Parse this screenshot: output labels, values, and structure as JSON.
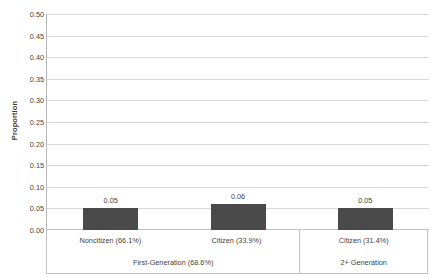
{
  "chart_data": {
    "type": "bar",
    "title": "",
    "subtitle": "",
    "xlabel": "",
    "ylabel": "Proportion",
    "ylim": [
      0.0,
      0.5
    ],
    "ytick_step": 0.05,
    "grid": true,
    "legend": false,
    "bar_color": "#4a4a4a",
    "gridline_color": "#d9d9d9",
    "axis_color": "#c3c3c3",
    "categories": [
      "Noncitizen (66.1%)",
      "Citizen (33.9%)",
      "Citizen (31.4%)"
    ],
    "values": [
      0.05,
      0.06,
      0.05
    ],
    "data_labels": [
      "0.05",
      "0.06",
      "0.05"
    ],
    "groups": [
      {
        "label": "First-Generation (68.6%)",
        "span": 2
      },
      {
        "label": "2+ Generation",
        "span": 1
      }
    ],
    "yticks": [
      {
        "value": 0.5,
        "label": "0.50"
      },
      {
        "value": 0.45,
        "label": "0.45"
      },
      {
        "value": 0.4,
        "label": "0.40"
      },
      {
        "value": 0.35,
        "label": "0.35"
      },
      {
        "value": 0.3,
        "label": "0.30"
      },
      {
        "value": 0.25,
        "label": "0.25"
      },
      {
        "value": 0.2,
        "label": "0.20"
      },
      {
        "value": 0.15,
        "label": "0.15"
      },
      {
        "value": 0.1,
        "label": "0.10"
      },
      {
        "value": 0.05,
        "label": "0.05"
      },
      {
        "value": 0.0,
        "label": "0.00"
      }
    ]
  }
}
